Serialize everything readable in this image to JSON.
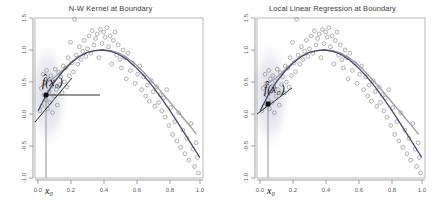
{
  "figure": {
    "background_color": "#ffffff",
    "width": 443,
    "height": 205
  },
  "panels": [
    {
      "id": "nw-kernel",
      "title": "N-W Kernel at Boundary",
      "fhat_label": "f̂(x₀)",
      "x0_label": "x₀"
    },
    {
      "id": "local-linear",
      "title": "Local Linear Regression at Boundary",
      "fhat_label": "f̂(x₀)",
      "x0_label": "x₀"
    }
  ],
  "style": {
    "true_curve_color": "#4a4a6e",
    "fit_curve_color": "#9a9a9a",
    "point_edge_color": "#8e8e8e",
    "kernel_fill_color": "#dcdce6",
    "marker_color": "#111111",
    "axis_color": "#7a7a7a",
    "tangent_color": "#333333",
    "vertical_line_color": "#8a8a8a"
  },
  "chart_data": {
    "type": "scatter",
    "n_panels": 2,
    "xlabel": "",
    "ylabel": "",
    "xlim": [
      -0.02,
      1.02
    ],
    "ylim": [
      -1.0,
      1.5
    ],
    "xticks": [
      0.0,
      0.2,
      0.4,
      0.6,
      0.8,
      1.0
    ],
    "xticklabels": [
      "0.0",
      "0.2",
      "0.4",
      "0.6",
      "0.8",
      "1.0"
    ],
    "yticks": [
      -1.0,
      -0.5,
      0.0,
      0.5,
      1.0,
      1.5
    ],
    "yticklabels": [
      "-1.0",
      "-0.5",
      "0.0",
      "0.5",
      "1.0",
      "1.5"
    ],
    "grid": false,
    "legend": null,
    "annotations": [
      {
        "text": "f̂(x₀)",
        "x": 0.07,
        "y": 0.68,
        "panel": 0
      },
      {
        "text": "x₀",
        "x": 0.05,
        "y": -1.12,
        "panel": 0
      },
      {
        "text": "f̂(x₀)",
        "x": 0.07,
        "y": 0.62,
        "panel": 1
      },
      {
        "text": "x₀",
        "x": 0.05,
        "y": -1.12,
        "panel": 1
      }
    ],
    "x0": 0.05,
    "fhat_at_x0": {
      "panel_0": 0.42,
      "panel_1": 0.27
    },
    "series": [
      {
        "name": "true curve f(x)",
        "type": "line",
        "color": "#4a4a6e",
        "x": [
          0.0,
          0.05,
          0.1,
          0.15,
          0.2,
          0.25,
          0.3,
          0.35,
          0.4,
          0.45,
          0.5,
          0.55,
          0.6,
          0.65,
          0.7,
          0.75,
          0.8,
          0.85,
          0.9,
          0.95,
          1.0
        ],
        "y": [
          0.05,
          0.3,
          0.5,
          0.66,
          0.79,
          0.89,
          0.96,
          0.99,
          1.0,
          0.98,
          0.93,
          0.85,
          0.74,
          0.61,
          0.46,
          0.29,
          0.11,
          -0.08,
          -0.28,
          -0.48,
          -0.68
        ]
      },
      {
        "name": "smoother fit",
        "type": "line",
        "color": "#9a9a9a",
        "x": [
          0.02,
          0.06,
          0.1,
          0.15,
          0.2,
          0.25,
          0.3,
          0.35,
          0.4,
          0.45,
          0.5,
          0.55,
          0.6,
          0.65,
          0.7,
          0.75,
          0.8,
          0.85,
          0.9,
          0.95,
          0.98
        ],
        "y": [
          0.44,
          0.5,
          0.57,
          0.68,
          0.8,
          0.9,
          0.96,
          0.99,
          1.0,
          0.99,
          0.95,
          0.88,
          0.78,
          0.66,
          0.52,
          0.38,
          0.23,
          0.08,
          -0.07,
          -0.22,
          -0.32
        ]
      },
      {
        "name": "observations",
        "type": "scatter",
        "marker": "open-circle",
        "color": "#8e8e8e",
        "x": [
          0.01,
          0.018,
          0.022,
          0.03,
          0.035,
          0.041,
          0.048,
          0.052,
          0.058,
          0.062,
          0.068,
          0.072,
          0.078,
          0.083,
          0.088,
          0.092,
          0.098,
          0.105,
          0.112,
          0.118,
          0.125,
          0.132,
          0.14,
          0.148,
          0.155,
          0.162,
          0.17,
          0.178,
          0.185,
          0.192,
          0.2,
          0.21,
          0.218,
          0.225,
          0.235,
          0.245,
          0.255,
          0.265,
          0.275,
          0.285,
          0.295,
          0.305,
          0.315,
          0.325,
          0.335,
          0.345,
          0.355,
          0.365,
          0.375,
          0.385,
          0.395,
          0.405,
          0.415,
          0.425,
          0.435,
          0.445,
          0.455,
          0.465,
          0.475,
          0.485,
          0.495,
          0.505,
          0.515,
          0.525,
          0.535,
          0.545,
          0.555,
          0.57,
          0.585,
          0.6,
          0.615,
          0.628,
          0.64,
          0.652,
          0.665,
          0.675,
          0.688,
          0.7,
          0.712,
          0.722,
          0.735,
          0.745,
          0.755,
          0.765,
          0.775,
          0.785,
          0.795,
          0.808,
          0.82,
          0.832,
          0.845,
          0.858,
          0.87,
          0.882,
          0.895,
          0.908,
          0.92,
          0.932,
          0.945,
          0.958,
          0.968,
          0.978,
          0.985,
          0.992
        ],
        "y": [
          0.05,
          0.4,
          0.12,
          0.62,
          0.3,
          0.48,
          0.22,
          0.68,
          0.08,
          0.55,
          0.35,
          0.18,
          0.6,
          0.44,
          0.02,
          0.52,
          0.28,
          0.7,
          0.38,
          0.14,
          0.65,
          0.46,
          0.58,
          0.33,
          0.75,
          0.5,
          0.72,
          0.42,
          0.88,
          0.6,
          1.12,
          0.8,
          0.66,
          1.48,
          0.92,
          0.78,
          1.05,
          0.85,
          0.98,
          1.15,
          0.9,
          1.02,
          1.22,
          0.95,
          1.3,
          1.08,
          1.18,
          1.25,
          0.88,
          1.32,
          1.1,
          1.28,
          1.2,
          1.35,
          1.05,
          1.22,
          0.78,
          1.15,
          1.28,
          0.92,
          1.08,
          0.85,
          0.72,
          1.0,
          0.88,
          0.55,
          0.95,
          0.68,
          0.8,
          0.48,
          0.62,
          0.75,
          0.38,
          0.58,
          0.28,
          0.45,
          0.2,
          0.52,
          0.35,
          0.12,
          0.42,
          0.18,
          0.3,
          0.05,
          0.25,
          -0.05,
          0.38,
          -0.18,
          0.1,
          -0.32,
          -0.12,
          -0.42,
          0.02,
          -0.52,
          -0.25,
          -0.62,
          -0.38,
          -0.72,
          -0.15,
          -0.55,
          -0.82,
          -0.45,
          -0.68,
          -0.92
        ]
      }
    ]
  }
}
